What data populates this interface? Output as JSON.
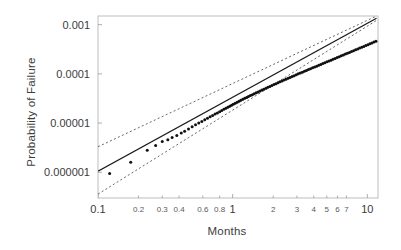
{
  "chart_data": {
    "type": "scatter",
    "title": "",
    "subtitle": "",
    "xlabel": "Months",
    "ylabel": "Probability of Failure",
    "xscale": "log",
    "yscale": "log",
    "xlim": [
      0.1,
      12.0
    ],
    "ylim": [
      3e-07,
      0.0015
    ],
    "grid": false,
    "legend_position": "none",
    "annotations": [],
    "x_ticks": [
      {
        "value": 0.1,
        "label": "0.1",
        "kind": "major"
      },
      {
        "value": 0.2,
        "label": "0.2",
        "kind": "minor"
      },
      {
        "value": 0.3,
        "label": "0.3",
        "kind": "minor"
      },
      {
        "value": 0.4,
        "label": "0.4",
        "kind": "minor"
      },
      {
        "value": 0.6,
        "label": "0.6",
        "kind": "minor"
      },
      {
        "value": 0.8,
        "label": "0.8",
        "kind": "minor"
      },
      {
        "value": 1,
        "label": "1",
        "kind": "major"
      },
      {
        "value": 2,
        "label": "2",
        "kind": "minor"
      },
      {
        "value": 3,
        "label": "3",
        "kind": "minor"
      },
      {
        "value": 4,
        "label": "4",
        "kind": "minor"
      },
      {
        "value": 5,
        "label": "5",
        "kind": "minor"
      },
      {
        "value": 6,
        "label": "6",
        "kind": "minor"
      },
      {
        "value": 7,
        "label": "7",
        "kind": "minor"
      },
      {
        "value": 10,
        "label": "10",
        "kind": "major"
      }
    ],
    "y_ticks": [
      {
        "value": 0.001,
        "label": "0.001"
      },
      {
        "value": 0.0001,
        "label": "0.0001"
      },
      {
        "value": 1e-05,
        "label": "0.00001"
      },
      {
        "value": 1e-06,
        "label": "0.000001"
      }
    ],
    "series": [
      {
        "name": "fit-line",
        "type": "line",
        "style": "solid",
        "color": "#1a1a1a",
        "points": [
          [
            0.1,
            1.05e-06
          ],
          [
            11.7,
            0.00135
          ]
        ]
      },
      {
        "name": "upper-confidence-bound",
        "type": "line",
        "style": "dashed",
        "color": "#555555",
        "points": [
          [
            0.1,
            3.3e-06
          ],
          [
            11.7,
            0.0015
          ]
        ]
      },
      {
        "name": "lower-confidence-bound",
        "type": "line",
        "style": "dashed",
        "color": "#555555",
        "points": [
          [
            0.1,
            3.6e-07
          ],
          [
            11.7,
            0.00122
          ]
        ]
      },
      {
        "name": "failure-observations",
        "type": "scatter",
        "color": "#111111",
        "marker": "circle",
        "points": [
          [
            0.122,
            9.4e-07
          ],
          [
            0.175,
            1.6e-06
          ],
          [
            0.232,
            2.8e-06
          ],
          [
            0.268,
            3.5e-06
          ],
          [
            0.3,
            4.2e-06
          ],
          [
            0.33,
            4.6e-06
          ],
          [
            0.355,
            5.1e-06
          ],
          [
            0.385,
            5.6e-06
          ],
          [
            0.415,
            6.3e-06
          ],
          [
            0.44,
            6.8e-06
          ],
          [
            0.47,
            7.6e-06
          ],
          [
            0.5,
            8.4e-06
          ],
          [
            0.53,
            9.2e-06
          ],
          [
            0.56,
            1e-05
          ],
          [
            0.59,
            1.08e-05
          ],
          [
            0.62,
            1.17e-05
          ],
          [
            0.65,
            1.25e-05
          ],
          [
            0.68,
            1.34e-05
          ],
          [
            0.71,
            1.43e-05
          ],
          [
            0.74,
            1.52e-05
          ],
          [
            0.77,
            1.61e-05
          ],
          [
            0.8,
            1.7e-05
          ],
          [
            0.83,
            1.8e-05
          ],
          [
            0.86,
            1.9e-05
          ],
          [
            0.89,
            2e-05
          ],
          [
            0.92,
            2.1e-05
          ],
          [
            0.95,
            2.2e-05
          ],
          [
            0.98,
            2.31e-05
          ],
          [
            1.01,
            2.42e-05
          ],
          [
            1.045,
            2.54e-05
          ],
          [
            1.08,
            2.66e-05
          ],
          [
            1.115,
            2.78e-05
          ],
          [
            1.15,
            2.9e-05
          ],
          [
            1.19,
            3.04e-05
          ],
          [
            1.23,
            3.18e-05
          ],
          [
            1.27,
            3.32e-05
          ],
          [
            1.31,
            3.46e-05
          ],
          [
            1.355,
            3.62e-05
          ],
          [
            1.4,
            3.78e-05
          ],
          [
            1.445,
            3.94e-05
          ],
          [
            1.495,
            4.12e-05
          ],
          [
            1.545,
            4.3e-05
          ],
          [
            1.595,
            4.48e-05
          ],
          [
            1.65,
            4.68e-05
          ],
          [
            1.705,
            4.88e-05
          ],
          [
            1.765,
            5.1e-05
          ],
          [
            1.825,
            5.32e-05
          ],
          [
            1.89,
            5.56e-05
          ],
          [
            1.955,
            5.8e-05
          ],
          [
            2.025,
            6.06e-05
          ],
          [
            2.095,
            6.32e-05
          ],
          [
            2.17,
            6.6e-05
          ],
          [
            2.245,
            6.88e-05
          ],
          [
            2.325,
            7.18e-05
          ],
          [
            2.405,
            7.48e-05
          ],
          [
            2.49,
            7.8e-05
          ],
          [
            2.58,
            8.14e-05
          ],
          [
            2.67,
            8.48e-05
          ],
          [
            2.765,
            8.84e-05
          ],
          [
            2.86,
            9.2e-05
          ],
          [
            2.965,
            9.6e-05
          ],
          [
            3.07,
            0.0001
          ],
          [
            3.18,
            0.0001042
          ],
          [
            3.29,
            0.0001084
          ],
          [
            3.41,
            0.000113
          ],
          [
            3.53,
            0.0001176
          ],
          [
            3.655,
            0.0001224
          ],
          [
            3.785,
            0.0001274
          ],
          [
            3.92,
            0.0001326
          ],
          [
            4.06,
            0.000138
          ],
          [
            4.205,
            0.0001436
          ],
          [
            4.355,
            0.0001494
          ],
          [
            4.51,
            0.0001556
          ],
          [
            4.67,
            0.000162
          ],
          [
            4.835,
            0.0001686
          ],
          [
            5.01,
            0.0001756
          ],
          [
            5.19,
            0.0001828
          ],
          [
            5.375,
            0.0001902
          ],
          [
            5.565,
            0.000198
          ],
          [
            5.765,
            0.0002062
          ],
          [
            5.97,
            0.0002146
          ],
          [
            6.185,
            0.0002234
          ],
          [
            6.405,
            0.0002326
          ],
          [
            6.635,
            0.000242
          ],
          [
            6.87,
            0.000252
          ],
          [
            7.115,
            0.0002622
          ],
          [
            7.37,
            0.000273
          ],
          [
            7.63,
            0.0002842
          ],
          [
            7.905,
            0.0002958
          ],
          [
            8.185,
            0.000308
          ],
          [
            8.475,
            0.0003206
          ],
          [
            8.775,
            0.0003336
          ],
          [
            9.085,
            0.0003474
          ],
          [
            9.41,
            0.0003616
          ],
          [
            9.745,
            0.0003764
          ],
          [
            10.09,
            0.0003918
          ],
          [
            10.445,
            0.0004078
          ],
          [
            10.815,
            0.0004244
          ],
          [
            11.195,
            0.0004418
          ],
          [
            11.59,
            0.0004598
          ]
        ]
      }
    ]
  },
  "plot_area": {
    "left": 98,
    "top": 16,
    "right": 378,
    "bottom": 198,
    "border_color": "#bdbdbd",
    "background": "#ffffff"
  }
}
